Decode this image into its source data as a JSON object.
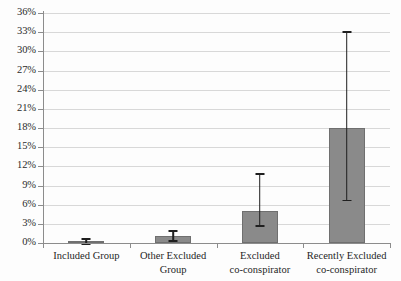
{
  "chart_data": {
    "type": "bar",
    "title": "",
    "subtitle": "",
    "xlabel": "",
    "ylabel": "",
    "ylim": [
      0,
      36
    ],
    "ytick_step": 3,
    "grid": true,
    "legend": null,
    "legend_position": "none",
    "value_unit": "%",
    "categories": [
      "Included Group",
      "Other Excluded Group",
      "Excluded co-conspirator",
      "Recently Excluded co-conspirator"
    ],
    "category_lines": [
      [
        "Included Group"
      ],
      [
        "Other Excluded",
        "Group"
      ],
      [
        "Excluded",
        "co-conspirator"
      ],
      [
        "Recently Excluded",
        "co-conspirator"
      ]
    ],
    "values": [
      0.3,
      1.1,
      5.0,
      18.0
    ],
    "error_low": [
      0.0,
      0.4,
      2.8,
      6.8
    ],
    "error_high": [
      0.8,
      2.0,
      11.0,
      33.2
    ],
    "ytick_labels": [
      "0%",
      "3%",
      "6%",
      "9%",
      "12%",
      "15%",
      "18%",
      "21%",
      "24%",
      "27%",
      "30%",
      "33%",
      "36%"
    ],
    "ytick_values": [
      0,
      3,
      6,
      9,
      12,
      15,
      18,
      21,
      24,
      27,
      30,
      33,
      36
    ],
    "colors": {
      "bar_fill": "#8a8a8a",
      "bar_stroke": "#6f6f6f",
      "error_bar": "#1f1f1f",
      "grid": "#d8d8d8",
      "axis": "#8c8c8c",
      "background": "#fdfdfd",
      "text": "#1f1f1f"
    }
  }
}
